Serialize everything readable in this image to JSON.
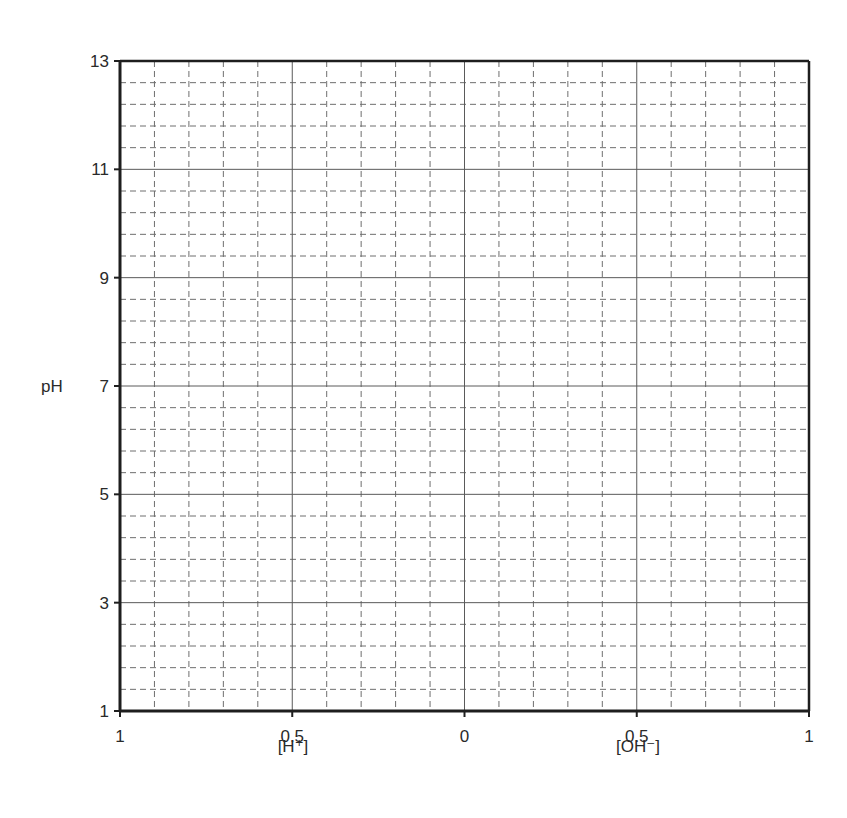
{
  "chart_data": {
    "type": "line",
    "title": "",
    "ylabel": "pH",
    "xlabel_left": "[H⁺]",
    "xlabel_right": "[OH⁻]",
    "ylim": [
      1,
      13
    ],
    "y_ticks": [
      1,
      3,
      5,
      7,
      9,
      11,
      13
    ],
    "x_ticks": [
      {
        "label": "1",
        "pos": -1
      },
      {
        "label": "0.5",
        "pos": -0.5
      },
      {
        "label": "0",
        "pos": 0
      },
      {
        "label": "0.5",
        "pos": 0.5
      },
      {
        "label": "1",
        "pos": 1
      }
    ],
    "xlim": [
      -1,
      1
    ],
    "x_minor_step": 0.1,
    "y_minor_step": 0.4,
    "grid": {
      "major": "solid",
      "minor": "dashed"
    },
    "series": [],
    "legend": null,
    "note": "Blank grid for plotting pH vs [H+] (left) and [OH-] (right)"
  },
  "colors": {
    "axis": "#1e1e1e",
    "major_grid": "#5a5a5a",
    "minor_grid": "#6e6e6e",
    "text": "#2a2a2a"
  }
}
